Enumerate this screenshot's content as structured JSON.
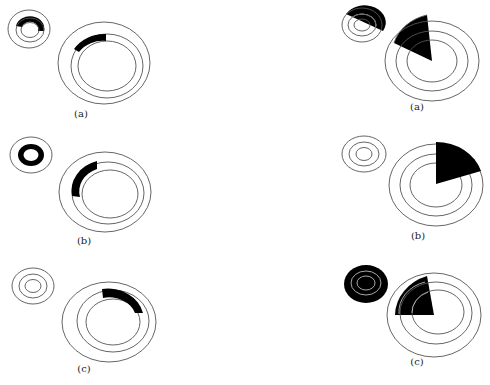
{
  "figure": {
    "left_column": [
      {
        "label": "(a)",
        "caption_pos": [
          81,
          114
        ]
      },
      {
        "label": "(b)",
        "caption_pos": [
          84,
          241
        ]
      },
      {
        "label": "(c)",
        "caption_pos": [
          84,
          369
        ]
      }
    ],
    "right_column": [
      {
        "label": "(a)",
        "caption_pos": [
          417,
          107
        ]
      },
      {
        "label": "(b)",
        "caption_pos": [
          418,
          236
        ]
      },
      {
        "label": "(c)",
        "caption_pos": [
          417,
          362
        ]
      }
    ]
  },
  "colors": {
    "stroke": "#555555",
    "fill": "#000000",
    "background": "#ffffff"
  }
}
